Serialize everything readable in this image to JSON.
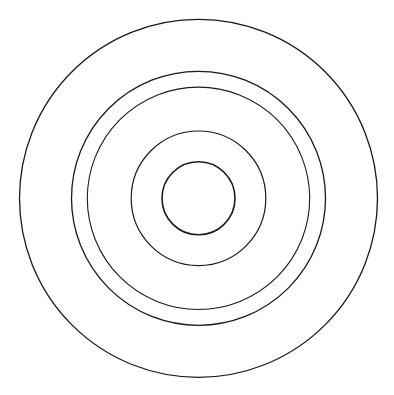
{
  "diagram": {
    "type": "concentric-circles",
    "background": "#ffffff",
    "stroke_color": "#1a1a1a",
    "center": {
      "cx": 198.5,
      "cy": 198.3
    },
    "circles": [
      {
        "name": "ring-1-outer",
        "r": 179,
        "stroke_width": 1.3
      },
      {
        "name": "ring-2",
        "r": 127,
        "stroke_width": 1.3
      },
      {
        "name": "ring-3",
        "r": 111.2,
        "stroke_width": 1.1
      },
      {
        "name": "ring-4",
        "r": 67.3,
        "stroke_width": 1.2
      },
      {
        "name": "ring-5-inner",
        "r": 36.5,
        "stroke_width": 1.6
      }
    ]
  }
}
